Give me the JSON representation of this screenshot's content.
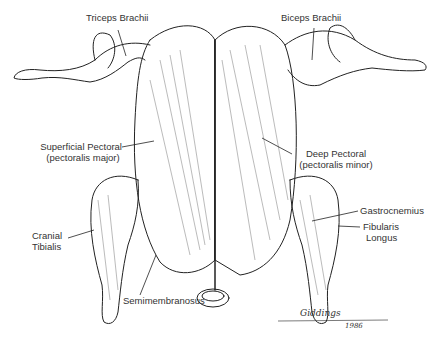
{
  "diagram": {
    "labels": {
      "triceps": "Triceps Brachii",
      "biceps": "Biceps Brachii",
      "sup_pec_1": "Superficial Pectoral",
      "sup_pec_2": "(pectoralis major)",
      "deep_pec_1": "Deep Pectoral",
      "deep_pec_2": "(pectoralis minor)",
      "cranial_1": "Cranial",
      "cranial_2": "Tibialis",
      "gastro": "Gastrocnemius",
      "fibularis_1": "Fibularis",
      "fibularis_2": "Longus",
      "semimem": "Semimembranosus"
    },
    "signature": {
      "name": "Giddings",
      "year": "1986"
    },
    "colors": {
      "ink": "#222222",
      "background": "#ffffff"
    }
  }
}
